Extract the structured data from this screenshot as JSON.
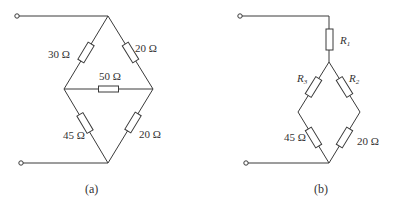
{
  "figure": {
    "panels": [
      {
        "id": "a",
        "caption": "(a)",
        "topology": "bridge",
        "resistors": {
          "top_left": "30 Ω",
          "top_right": "20 Ω",
          "middle": "50 Ω",
          "bottom_left": "45 Ω",
          "bottom_right": "20 Ω"
        }
      },
      {
        "id": "b",
        "caption": "(b)",
        "topology": "star-converted bridge",
        "resistors": {
          "top": {
            "symbol": "R",
            "subscript": "1"
          },
          "upper_left": {
            "symbol": "R",
            "subscript": "3"
          },
          "upper_right": {
            "symbol": "R",
            "subscript": "2"
          },
          "bottom_left": "45 Ω",
          "bottom_right": "20 Ω"
        }
      }
    ]
  }
}
